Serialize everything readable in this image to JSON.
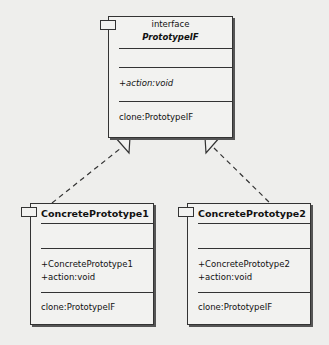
{
  "interface": {
    "stereotype": "interface",
    "name": "PrototypeIF",
    "attributes": "",
    "operations": [
      "+action:void"
    ],
    "extra": [
      "clone:PrototypeIF"
    ]
  },
  "classes": [
    {
      "name": "ConcretePrototype1",
      "attributes": "",
      "operations": [
        "+ConcretePrototype1",
        "+action:void"
      ],
      "extra": [
        "clone:PrototypeIF"
      ]
    },
    {
      "name": "ConcretePrototype2",
      "attributes": "",
      "operations": [
        "+ConcretePrototype2",
        "+action:void"
      ],
      "extra": [
        "clone:PrototypeIF"
      ]
    }
  ],
  "relations": [
    {
      "type": "realization",
      "from": "ConcretePrototype1",
      "to": "PrototypeIF"
    },
    {
      "type": "realization",
      "from": "ConcretePrototype2",
      "to": "PrototypeIF"
    }
  ]
}
